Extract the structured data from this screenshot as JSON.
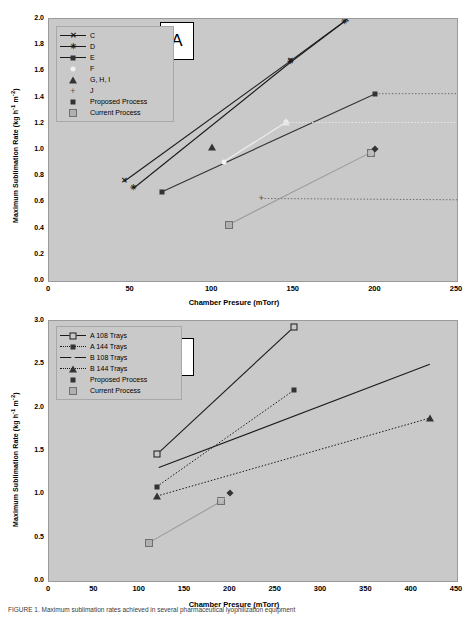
{
  "figure": {
    "caption": "FIGURE 1. Maximum sublimation rates achieved in several pharmaceutical lyophilization equipment"
  },
  "panelA": {
    "label": "A",
    "axes": {
      "ylabel": "Maximum Sublimation Rate (kg h",
      "ylabel_sup1": "-1",
      "ylabel_mid": " m",
      "ylabel_sup2": "-2",
      "ylabel_end": ")",
      "xlabel": "Chamber Presure (mTorr)",
      "yticks": [
        "0.0",
        "0.2",
        "0.4",
        "0.6",
        "0.8",
        "1.0",
        "1.2",
        "1.4",
        "1.6",
        "1.8",
        "2.0"
      ],
      "xticks": [
        "0",
        "50",
        "100",
        "150",
        "200",
        "250"
      ]
    },
    "legend": [
      {
        "label": "C",
        "marker": "x",
        "line": "solid"
      },
      {
        "label": "D",
        "marker": "star",
        "line": "solid"
      },
      {
        "label": "E",
        "marker": "square-filled",
        "line": "solid"
      },
      {
        "label": "F",
        "marker": "dot-light",
        "line": "none"
      },
      {
        "label": "G, H, I",
        "marker": "triangle-filled",
        "line": "none"
      },
      {
        "label": "J",
        "marker": "plus",
        "line": "none"
      },
      {
        "label": "Proposed Process",
        "marker": "diamond",
        "line": "none"
      },
      {
        "label": "Current Process",
        "marker": "square-gray",
        "line": "none"
      }
    ]
  },
  "panelB": {
    "label": "B",
    "axes": {
      "ylabel": "Maximum Sublimation Rate (kg h",
      "ylabel_sup1": "-1",
      "ylabel_mid": " m",
      "ylabel_sup2": "-2",
      "ylabel_end": ")",
      "xlabel": "Chamber Presure (mTorr)",
      "yticks": [
        "0.0",
        "0.5",
        "1.0",
        "1.5",
        "2.0",
        "2.5",
        "3.0"
      ],
      "xticks": [
        "0",
        "50",
        "100",
        "150",
        "200",
        "250",
        "300",
        "350",
        "400",
        "450"
      ]
    },
    "legend": [
      {
        "label": "A 108 Trays",
        "marker": "square-open",
        "line": "solid"
      },
      {
        "label": "A 144 Trays",
        "marker": "square-filled",
        "line": "dotted"
      },
      {
        "label": "B 108 Trays",
        "marker": "triangle-open",
        "line": "solid"
      },
      {
        "label": "B 144 Trays",
        "marker": "triangle-filled",
        "line": "dotted"
      },
      {
        "label": "Proposed Process",
        "marker": "diamond",
        "line": "none"
      },
      {
        "label": "Current Process",
        "marker": "square-gray",
        "line": "none"
      }
    ]
  },
  "chart_data": [
    {
      "type": "line",
      "title": "A",
      "xlabel": "Chamber Presure (mTorr)",
      "ylabel": "Maximum Sublimation Rate (kg h-1 m-2)",
      "xlim": [
        0,
        250
      ],
      "ylim": [
        0.0,
        2.0
      ],
      "xticks": [
        0,
        50,
        100,
        150,
        200,
        250
      ],
      "yticks": [
        0.0,
        0.2,
        0.4,
        0.6,
        0.8,
        1.0,
        1.2,
        1.4,
        1.6,
        1.8,
        2.0
      ],
      "grid": false,
      "legend_position": "upper-left",
      "series": [
        {
          "name": "C",
          "style": "solid",
          "color": "#1a1a1a",
          "marker": "x",
          "points": [
            [
              46,
              0.76
            ],
            [
              148,
              1.68
            ],
            [
              182,
              1.99
            ]
          ]
        },
        {
          "name": "D",
          "style": "solid",
          "color": "#1a1a1a",
          "marker": "star",
          "points": [
            [
              52,
              0.71
            ],
            [
              148,
              1.67
            ],
            [
              181,
              1.98
            ]
          ]
        },
        {
          "name": "E",
          "style": "solid",
          "color": "#333333",
          "marker": "square-filled",
          "points": [
            [
              69,
              0.68
            ],
            [
              200,
              1.43
            ]
          ]
        },
        {
          "name": "E extension",
          "style": "dotted",
          "color": "#6f6f6f",
          "marker": "none",
          "points": [
            [
              200,
              1.43
            ],
            [
              250,
              1.43
            ]
          ]
        },
        {
          "name": "F",
          "style": "solid",
          "color": "#efefef",
          "marker": "dot-light",
          "points": [
            [
              107,
              0.91
            ],
            [
              145,
              1.21
            ]
          ]
        },
        {
          "name": "F extension",
          "style": "dotted",
          "color": "#e8e8e8",
          "marker": "none",
          "points": [
            [
              145,
              1.21
            ],
            [
              250,
              1.21
            ]
          ]
        },
        {
          "name": "G, H, I",
          "style": "none",
          "color": "#333333",
          "marker": "triangle-filled",
          "points": [
            [
              100,
              1.02
            ]
          ]
        },
        {
          "name": "J",
          "style": "none",
          "color": "#555555",
          "marker": "plus",
          "points": [
            [
              130,
              0.63
            ]
          ]
        },
        {
          "name": "J extension",
          "style": "dotted",
          "color": "#6f6f6f",
          "marker": "none",
          "points": [
            [
              130,
              0.63
            ],
            [
              250,
              0.62
            ]
          ]
        },
        {
          "name": "Current Process",
          "style": "solid",
          "color": "#9a9a9a",
          "marker": "square-gray",
          "points": [
            [
              110,
              0.43
            ],
            [
              197,
              0.98
            ]
          ]
        },
        {
          "name": "Proposed Process",
          "style": "none",
          "color": "#333333",
          "marker": "diamond",
          "points": [
            [
              200,
              1.01
            ]
          ]
        }
      ]
    },
    {
      "type": "line",
      "title": "B",
      "xlabel": "Chamber Presure (mTorr)",
      "ylabel": "Maximum Sublimation Rate (kg h-1 m-2)",
      "xlim": [
        0,
        450
      ],
      "ylim": [
        0.0,
        3.0
      ],
      "xticks": [
        0,
        50,
        100,
        150,
        200,
        250,
        300,
        350,
        400,
        450
      ],
      "yticks": [
        0.0,
        0.5,
        1.0,
        1.5,
        2.0,
        2.5,
        3.0
      ],
      "grid": false,
      "legend_position": "upper-left",
      "series": [
        {
          "name": "A 108 Trays",
          "style": "solid",
          "color": "#1a1a1a",
          "marker": "square-open",
          "points": [
            [
              119,
              1.46
            ],
            [
              270,
              2.93
            ]
          ]
        },
        {
          "name": "A 144 Trays",
          "style": "dotted",
          "color": "#1a1a1a",
          "marker": "square-filled",
          "points": [
            [
              119,
              1.09
            ],
            [
              270,
              2.2
            ]
          ]
        },
        {
          "name": "B 108 Trays",
          "style": "solid",
          "color": "#1a1a1a",
          "marker": "triangle-open",
          "points": [
            [
              119,
              1.3
            ],
            [
              420,
              2.5
            ]
          ]
        },
        {
          "name": "B 144 Trays",
          "style": "dotted",
          "color": "#1a1a1a",
          "marker": "triangle-filled",
          "points": [
            [
              119,
              0.98
            ],
            [
              420,
              1.88
            ]
          ]
        },
        {
          "name": "Current Process",
          "style": "solid",
          "color": "#9a9a9a",
          "marker": "square-gray",
          "points": [
            [
              110,
              0.44
            ],
            [
              190,
              0.92
            ]
          ]
        },
        {
          "name": "Proposed Process",
          "style": "none",
          "color": "#333333",
          "marker": "diamond",
          "points": [
            [
              200,
              1.01
            ]
          ]
        }
      ]
    }
  ]
}
